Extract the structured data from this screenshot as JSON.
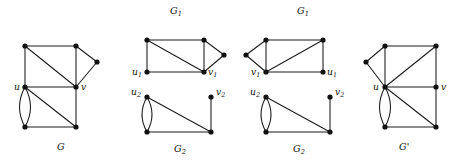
{
  "figure": {
    "background_color": "#ffffff",
    "ink_color": "#111111",
    "edge_color": "#1a1a1a",
    "vertex_radius": 2.6,
    "panels": [
      {
        "id": "panel-G",
        "caption": "G",
        "caption_pos": {
          "x": 57,
          "y": 150
        },
        "top_label": null,
        "vertices": [
          {
            "name": "a",
            "x": 25,
            "y": 46
          },
          {
            "name": "b",
            "x": 76,
            "y": 46
          },
          {
            "name": "p",
            "x": 97,
            "y": 62
          },
          {
            "name": "u",
            "x": 25,
            "y": 87
          },
          {
            "name": "v",
            "x": 76,
            "y": 87
          },
          {
            "name": "c",
            "x": 25,
            "y": 127
          },
          {
            "name": "d",
            "x": 76,
            "y": 127
          }
        ],
        "edges": [
          {
            "from": "a",
            "to": "b",
            "type": "straight"
          },
          {
            "from": "a",
            "to": "u",
            "type": "straight"
          },
          {
            "from": "a",
            "to": "v",
            "type": "straight"
          },
          {
            "from": "b",
            "to": "p",
            "type": "straight"
          },
          {
            "from": "b",
            "to": "v",
            "type": "straight"
          },
          {
            "from": "p",
            "to": "v",
            "type": "straight"
          },
          {
            "from": "u",
            "to": "v",
            "type": "straight"
          },
          {
            "from": "u",
            "to": "d",
            "type": "straight"
          },
          {
            "from": "u",
            "to": "c",
            "type": "multi-left",
            "bow": 11
          },
          {
            "from": "u",
            "to": "c",
            "type": "multi-right",
            "bow": -11
          },
          {
            "from": "c",
            "to": "d",
            "type": "straight"
          },
          {
            "from": "v",
            "to": "d",
            "type": "straight"
          }
        ],
        "labels": [
          {
            "text": "u",
            "sub": "",
            "x": 14,
            "y": 90
          },
          {
            "text": "v",
            "sub": "",
            "x": 81,
            "y": 90
          }
        ]
      },
      {
        "id": "panel-G1-left",
        "caption": null,
        "top_label": {
          "text": "G",
          "sub": "1",
          "x": 170,
          "y": 14
        },
        "vertices": [
          {
            "name": "a",
            "x": 147,
            "y": 40
          },
          {
            "name": "b",
            "x": 204,
            "y": 40
          },
          {
            "name": "p",
            "x": 224,
            "y": 55
          },
          {
            "name": "u1",
            "x": 147,
            "y": 72
          },
          {
            "name": "v1",
            "x": 204,
            "y": 72
          }
        ],
        "edges": [
          {
            "from": "a",
            "to": "b",
            "type": "straight"
          },
          {
            "from": "a",
            "to": "u1",
            "type": "straight"
          },
          {
            "from": "a",
            "to": "v1",
            "type": "straight"
          },
          {
            "from": "b",
            "to": "p",
            "type": "straight"
          },
          {
            "from": "b",
            "to": "v1",
            "type": "straight"
          },
          {
            "from": "p",
            "to": "v1",
            "type": "straight"
          },
          {
            "from": "u1",
            "to": "v1",
            "type": "straight"
          }
        ],
        "labels": [
          {
            "text": "u",
            "sub": "1",
            "x": 132,
            "y": 75
          },
          {
            "text": "v",
            "sub": "1",
            "x": 208,
            "y": 75
          }
        ]
      },
      {
        "id": "panel-G2-left",
        "caption": "G",
        "caption_sub": "2",
        "caption_pos": {
          "x": 174,
          "y": 152
        },
        "top_label": null,
        "vertices": [
          {
            "name": "u2",
            "x": 147,
            "y": 97
          },
          {
            "name": "v2",
            "x": 211,
            "y": 97
          },
          {
            "name": "c",
            "x": 147,
            "y": 132
          },
          {
            "name": "d",
            "x": 211,
            "y": 132
          }
        ],
        "edges": [
          {
            "from": "u2",
            "to": "c",
            "type": "multi-left",
            "bow": 10
          },
          {
            "from": "u2",
            "to": "c",
            "type": "multi-right",
            "bow": -10
          },
          {
            "from": "u2",
            "to": "d",
            "type": "straight"
          },
          {
            "from": "c",
            "to": "d",
            "type": "straight"
          },
          {
            "from": "v2",
            "to": "d",
            "type": "straight"
          }
        ],
        "labels": [
          {
            "text": "u",
            "sub": "2",
            "x": 131,
            "y": 95
          },
          {
            "text": "v",
            "sub": "2",
            "x": 216,
            "y": 95
          }
        ]
      },
      {
        "id": "panel-G1-right",
        "caption": null,
        "top_label": {
          "text": "G",
          "sub": "1",
          "x": 297,
          "y": 14
        },
        "vertices": [
          {
            "name": "a",
            "x": 266,
            "y": 40
          },
          {
            "name": "b",
            "x": 323,
            "y": 40
          },
          {
            "name": "p",
            "x": 246,
            "y": 55
          },
          {
            "name": "v1",
            "x": 266,
            "y": 72
          },
          {
            "name": "u1",
            "x": 323,
            "y": 72
          }
        ],
        "edges": [
          {
            "from": "a",
            "to": "b",
            "type": "straight"
          },
          {
            "from": "a",
            "to": "v1",
            "type": "straight"
          },
          {
            "from": "a",
            "to": "p",
            "type": "straight"
          },
          {
            "from": "p",
            "to": "v1",
            "type": "straight"
          },
          {
            "from": "b",
            "to": "v1",
            "type": "straight"
          },
          {
            "from": "b",
            "to": "u1",
            "type": "straight"
          },
          {
            "from": "v1",
            "to": "u1",
            "type": "straight"
          }
        ],
        "labels": [
          {
            "text": "v",
            "sub": "1",
            "x": 251,
            "y": 75
          },
          {
            "text": "u",
            "sub": "1",
            "x": 327,
            "y": 75
          }
        ]
      },
      {
        "id": "panel-G2-right",
        "caption": "G",
        "caption_sub": "2",
        "caption_pos": {
          "x": 293,
          "y": 152
        },
        "top_label": null,
        "vertices": [
          {
            "name": "u2",
            "x": 266,
            "y": 97
          },
          {
            "name": "v2",
            "x": 330,
            "y": 97
          },
          {
            "name": "c",
            "x": 266,
            "y": 132
          },
          {
            "name": "d",
            "x": 330,
            "y": 132
          }
        ],
        "edges": [
          {
            "from": "u2",
            "to": "c",
            "type": "multi-left",
            "bow": 10
          },
          {
            "from": "u2",
            "to": "c",
            "type": "multi-right",
            "bow": -10
          },
          {
            "from": "u2",
            "to": "d",
            "type": "straight"
          },
          {
            "from": "c",
            "to": "d",
            "type": "straight"
          },
          {
            "from": "v2",
            "to": "d",
            "type": "straight"
          }
        ],
        "labels": [
          {
            "text": "u",
            "sub": "2",
            "x": 250,
            "y": 95
          },
          {
            "text": "v",
            "sub": "2",
            "x": 335,
            "y": 95
          }
        ]
      },
      {
        "id": "panel-Gprime",
        "caption": "G'",
        "caption_pos": {
          "x": 399,
          "y": 150
        },
        "top_label": null,
        "vertices": [
          {
            "name": "a",
            "x": 385,
            "y": 46
          },
          {
            "name": "b",
            "x": 436,
            "y": 46
          },
          {
            "name": "p",
            "x": 366,
            "y": 62
          },
          {
            "name": "u",
            "x": 385,
            "y": 87
          },
          {
            "name": "v",
            "x": 436,
            "y": 87
          },
          {
            "name": "c",
            "x": 385,
            "y": 127
          },
          {
            "name": "d",
            "x": 436,
            "y": 127
          }
        ],
        "edges": [
          {
            "from": "a",
            "to": "b",
            "type": "straight"
          },
          {
            "from": "a",
            "to": "p",
            "type": "straight"
          },
          {
            "from": "a",
            "to": "u",
            "type": "straight"
          },
          {
            "from": "p",
            "to": "u",
            "type": "straight"
          },
          {
            "from": "b",
            "to": "u",
            "type": "straight"
          },
          {
            "from": "b",
            "to": "v",
            "type": "straight"
          },
          {
            "from": "u",
            "to": "v",
            "type": "straight"
          },
          {
            "from": "u",
            "to": "d",
            "type": "straight"
          },
          {
            "from": "u",
            "to": "c",
            "type": "multi-left",
            "bow": 11
          },
          {
            "from": "u",
            "to": "c",
            "type": "multi-right",
            "bow": -11
          },
          {
            "from": "c",
            "to": "d",
            "type": "straight"
          },
          {
            "from": "v",
            "to": "d",
            "type": "straight"
          }
        ],
        "labels": [
          {
            "text": "u",
            "sub": "",
            "x": 373,
            "y": 90
          },
          {
            "text": "v",
            "sub": "",
            "x": 441,
            "y": 90
          }
        ]
      }
    ]
  }
}
